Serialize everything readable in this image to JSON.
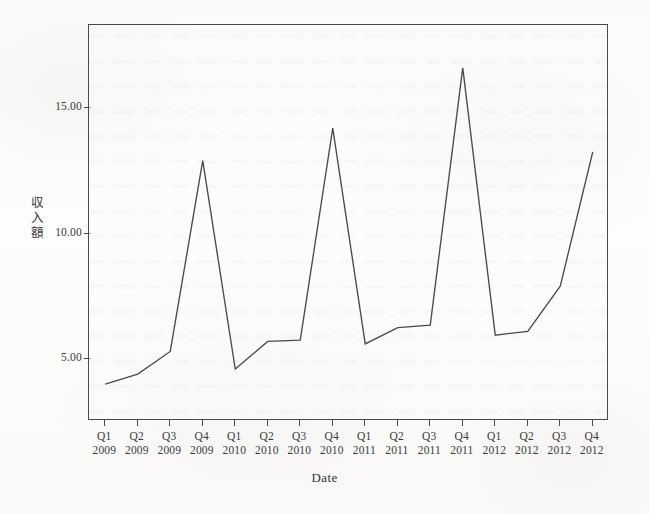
{
  "chart_data": {
    "type": "line",
    "title": "",
    "xlabel": "Date",
    "ylabel": "収入額",
    "ylabel_chars": [
      "収",
      "入",
      "額"
    ],
    "categories": [
      "Q1 2009",
      "Q2 2009",
      "Q3 2009",
      "Q4 2009",
      "Q1 2010",
      "Q2 2010",
      "Q3 2010",
      "Q4 2010",
      "Q1 2011",
      "Q2 2011",
      "Q3 2011",
      "Q4 2011",
      "Q1 2012",
      "Q2 2012",
      "Q3 2012",
      "Q4 2012"
    ],
    "quarters": [
      "Q1",
      "Q2",
      "Q3",
      "Q4",
      "Q1",
      "Q2",
      "Q3",
      "Q4",
      "Q1",
      "Q2",
      "Q3",
      "Q4",
      "Q1",
      "Q2",
      "Q3",
      "Q4"
    ],
    "years": [
      "2009",
      "2009",
      "2009",
      "2009",
      "2010",
      "2010",
      "2010",
      "2010",
      "2011",
      "2011",
      "2011",
      "2011",
      "2012",
      "2012",
      "2012",
      "2012"
    ],
    "values": [
      4.0,
      4.4,
      5.3,
      12.9,
      4.6,
      5.7,
      5.75,
      14.2,
      5.6,
      6.25,
      6.35,
      16.6,
      5.95,
      6.1,
      7.9,
      13.25
    ],
    "series": [
      {
        "name": "収入額",
        "values": [
          4.0,
          4.4,
          5.3,
          12.9,
          4.6,
          5.7,
          5.75,
          14.2,
          5.6,
          6.25,
          6.35,
          16.6,
          5.95,
          6.1,
          7.9,
          13.25
        ]
      }
    ],
    "ytick_labels": [
      "5.00",
      "10.00",
      "15.00"
    ],
    "ytick_values": [
      5,
      10,
      15
    ],
    "ylim": [
      1.2,
      17.6
    ],
    "grid": false,
    "legend": false,
    "line_color": "#4a4a4a",
    "frame_color": "#4a4a4a",
    "background_color": "#fdfdfc"
  },
  "axis": {
    "x_title": "Date",
    "y_title_chars": [
      "収",
      "入",
      "額"
    ]
  }
}
